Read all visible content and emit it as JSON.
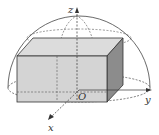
{
  "diagram": {
    "labels": {
      "z_axis": "z",
      "x_axis": "x",
      "y_axis": "y",
      "origin": "O"
    },
    "colors": {
      "box_front": "#d4d4d4",
      "box_top": "#dcdcdc",
      "box_side": "#8c8c8c",
      "lines": "#333333"
    }
  }
}
